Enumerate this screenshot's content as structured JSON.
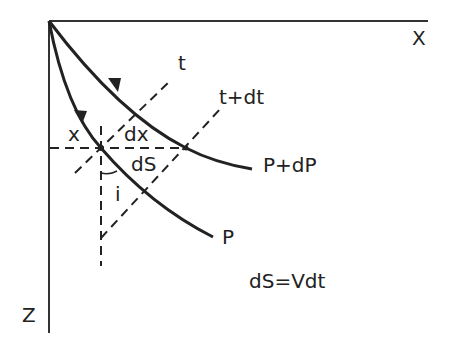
{
  "diagram": {
    "colors": {
      "ink": "#222222",
      "background": "#ffffff"
    },
    "axes": {
      "x_label": "X",
      "z_label": "Z"
    },
    "wavefronts": {
      "t": "t",
      "t_dt": "t+dt"
    },
    "rays": {
      "p": "P",
      "p_dp": "P+dP"
    },
    "annotations": {
      "x": "x",
      "dx": "dx",
      "ds": "dS",
      "angle_i": "i",
      "equation": "dS=Vdt"
    }
  }
}
